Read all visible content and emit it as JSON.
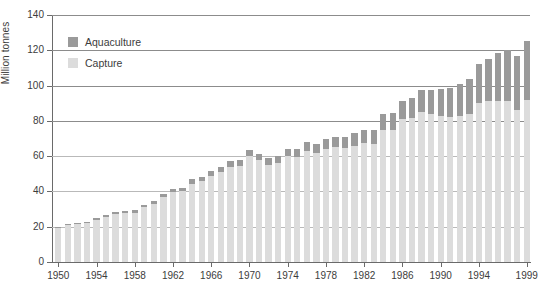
{
  "chart_data": {
    "type": "bar",
    "subtype": "stacked-bar",
    "title": "",
    "xlabel": "",
    "ylabel": "Million tonnes",
    "ylim": [
      0,
      140
    ],
    "ytick_step": 20,
    "yticks": [
      0,
      20,
      40,
      60,
      80,
      100,
      120,
      140
    ],
    "grid": true,
    "grid_axis": "y",
    "legend_position": "top-left",
    "xtick_labels": [
      "1950",
      "1954",
      "1958",
      "1962",
      "1966",
      "1970",
      "1974",
      "1978",
      "1982",
      "1986",
      "1990",
      "1994",
      "1999"
    ],
    "categories": [
      "1950",
      "1951",
      "1952",
      "1953",
      "1954",
      "1955",
      "1956",
      "1957",
      "1958",
      "1959",
      "1960",
      "1961",
      "1962",
      "1963",
      "1964",
      "1965",
      "1966",
      "1967",
      "1968",
      "1969",
      "1970",
      "1971",
      "1972",
      "1973",
      "1974",
      "1975",
      "1976",
      "1977",
      "1978",
      "1979",
      "1980",
      "1981",
      "1982",
      "1983",
      "1984",
      "1985",
      "1986",
      "1987",
      "1988",
      "1989",
      "1990",
      "1991",
      "1992",
      "1993",
      "1994",
      "1995",
      "1996",
      "1997",
      "1998",
      "1999"
    ],
    "series": [
      {
        "name": "Capture",
        "color": "#dcdcdc",
        "values": [
          19.0,
          21.0,
          21.5,
          22.0,
          24.0,
          25.5,
          27.0,
          27.5,
          28.0,
          31.0,
          33.0,
          37.0,
          39.5,
          40.0,
          44.5,
          46.0,
          49.0,
          51.0,
          54.0,
          54.5,
          60.0,
          58.0,
          55.0,
          56.0,
          60.0,
          59.5,
          63.0,
          62.0,
          64.0,
          65.0,
          64.5,
          66.0,
          67.5,
          67.0,
          75.0,
          75.0,
          81.0,
          81.5,
          85.0,
          84.0,
          83.0,
          82.0,
          83.0,
          84.0,
          90.0,
          91.0,
          91.5,
          91.0,
          86.0,
          92.0
        ]
      },
      {
        "name": "Aquaculture",
        "color": "#9a9a9a",
        "values": [
          0.6,
          0.7,
          0.8,
          0.9,
          1.0,
          1.1,
          1.2,
          1.3,
          1.4,
          1.6,
          1.7,
          1.8,
          2.0,
          2.1,
          2.3,
          2.4,
          2.6,
          2.8,
          3.0,
          3.1,
          3.3,
          3.5,
          3.7,
          3.9,
          4.2,
          4.5,
          4.8,
          5.1,
          5.5,
          6.0,
          6.5,
          7.0,
          7.5,
          8.0,
          8.8,
          9.5,
          10.5,
          11.5,
          12.5,
          13.5,
          15.0,
          16.5,
          18.0,
          20.0,
          22.0,
          24.0,
          27.0,
          29.0,
          31.0,
          33.5
        ]
      }
    ],
    "totals": [
      19.6,
      21.7,
      22.3,
      22.9,
      25.0,
      26.6,
      28.2,
      28.8,
      29.4,
      32.6,
      34.7,
      38.8,
      41.5,
      42.1,
      46.8,
      48.4,
      51.6,
      53.8,
      57.0,
      57.6,
      63.3,
      61.5,
      58.7,
      59.9,
      64.2,
      64.0,
      67.8,
      67.1,
      69.5,
      71.0,
      71.0,
      73.0,
      75.0,
      75.0,
      83.8,
      84.5,
      91.5,
      93.0,
      97.5,
      97.5,
      98.0,
      98.5,
      101.0,
      104.0,
      112.0,
      115.0,
      118.5,
      120.0,
      117.0,
      125.5
    ]
  },
  "legend": {
    "items": [
      {
        "label": "Aquaculture",
        "color": "#9a9a9a"
      },
      {
        "label": "Capture",
        "color": "#dcdcdc"
      }
    ]
  }
}
